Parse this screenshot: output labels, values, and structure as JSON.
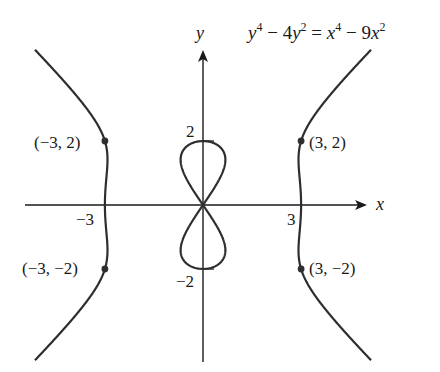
{
  "equation": {
    "lhs_var": "y",
    "lhs_exp1": "4",
    "lhs_mid": " − 4",
    "lhs_var2": "y",
    "lhs_exp2": "2",
    "eq": " = ",
    "rhs_var": "x",
    "rhs_exp1": "4",
    "rhs_mid": " − 9",
    "rhs_var2": "x",
    "rhs_exp2": "2"
  },
  "axes": {
    "x_label": "x",
    "y_label": "y",
    "x_ticks": [
      {
        "value": -3,
        "label": "−3"
      },
      {
        "value": 3,
        "label": "3"
      }
    ],
    "y_ticks": [
      {
        "value": 2,
        "label": "2"
      },
      {
        "value": -2,
        "label": "−2"
      }
    ]
  },
  "points": [
    {
      "x": -3,
      "y": 2,
      "label": "(−3, 2)"
    },
    {
      "x": 3,
      "y": 2,
      "label": "(3, 2)"
    },
    {
      "x": -3,
      "y": -2,
      "label": "(−3, −2)"
    },
    {
      "x": 3,
      "y": -2,
      "label": "(3, −2)"
    }
  ],
  "colors": {
    "curve": "#2e2e2e",
    "axis": "#1a1a1a",
    "background": "#ffffff"
  }
}
